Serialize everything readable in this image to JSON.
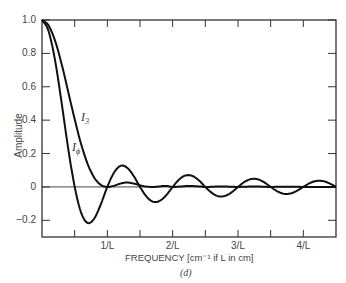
{
  "chart_data": {
    "type": "line",
    "title": "",
    "caption": "(d)",
    "xlabel": "FREQUENCY [cm⁻¹ if L in cm]",
    "ylabel": "Amplitude",
    "xlim": [
      0,
      4.5
    ],
    "ylim": [
      -0.3,
      1.0
    ],
    "grid": false,
    "x_ticks": [
      {
        "value": 1,
        "label": "1/L"
      },
      {
        "value": 2,
        "label": "2/L"
      },
      {
        "value": 3,
        "label": "3/L"
      },
      {
        "value": 4,
        "label": "4/L"
      }
    ],
    "y_ticks": [
      {
        "value": 1.0,
        "label": "1.0"
      },
      {
        "value": 0.8,
        "label": "0.8"
      },
      {
        "value": 0.6,
        "label": "0.6"
      },
      {
        "value": 0.4,
        "label": "0.4"
      },
      {
        "value": 0.2,
        "label": "0.2"
      },
      {
        "value": 0,
        "label": "0"
      },
      {
        "value": -0.2,
        "label": "−0.2"
      }
    ],
    "x": [
      0,
      0.1,
      0.2,
      0.3,
      0.4,
      0.5,
      0.6,
      0.7,
      0.8,
      0.9,
      1.0,
      1.1,
      1.2,
      1.3,
      1.4,
      1.5,
      1.6,
      1.7,
      1.8,
      1.9,
      2.0,
      2.1,
      2.2,
      2.3,
      2.4,
      2.5,
      2.6,
      2.7,
      2.8,
      2.9,
      3.0,
      3.1,
      3.2,
      3.3,
      3.4,
      3.5,
      3.6,
      3.7,
      3.8,
      3.9,
      4.0,
      4.1,
      4.2,
      4.3,
      4.4,
      4.5
    ],
    "series": [
      {
        "name": "I_3",
        "label_main": "I",
        "label_sub": "3",
        "values": [
          1,
          0.968,
          0.875,
          0.737,
          0.573,
          0.405,
          0.255,
          0.137,
          0.055,
          0.012,
          0,
          0.007,
          0.02,
          0.026,
          0.021,
          0.01,
          0.002,
          0,
          0.003,
          0.006,
          0,
          0.002,
          0.005,
          0.005,
          0.003,
          0,
          0.001,
          0.002,
          0.002,
          0.001,
          0,
          0.001,
          0.002,
          0.002,
          0.001,
          0,
          0.001,
          0.001,
          0.001,
          0.001,
          0,
          0,
          0,
          0,
          0,
          0
        ]
      },
      {
        "name": "I_phi",
        "label_main": "I",
        "label_sub": "ϕ",
        "values": [
          1,
          0.935,
          0.757,
          0.505,
          0.234,
          0,
          -0.156,
          -0.216,
          -0.189,
          -0.104,
          0,
          0.085,
          0.126,
          0.116,
          0.067,
          0,
          -0.058,
          -0.089,
          -0.084,
          -0.05,
          0,
          0.045,
          0.069,
          0.066,
          0.04,
          0,
          -0.036,
          -0.056,
          -0.054,
          -0.033,
          0,
          0.03,
          0.047,
          0.046,
          0.028,
          0,
          -0.026,
          -0.041,
          -0.04,
          -0.024,
          0,
          0.023,
          0.036,
          0.035,
          0.021,
          0
        ]
      }
    ]
  }
}
